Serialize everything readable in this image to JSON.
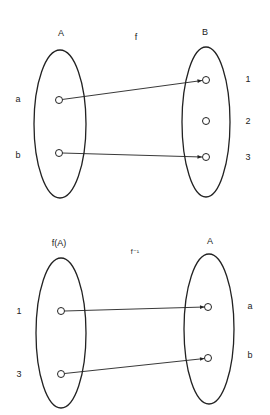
{
  "diagrams": [
    {
      "name": "function-f",
      "mapping_label": "f",
      "domain_set": {
        "label": "A",
        "elements": [
          "a",
          "b"
        ]
      },
      "codomain_set": {
        "label": "B",
        "elements": [
          "1",
          "2",
          "3"
        ]
      },
      "arrows": [
        {
          "from": "a",
          "to": "1"
        },
        {
          "from": "b",
          "to": "3"
        }
      ]
    },
    {
      "name": "inverse-function",
      "mapping_label": "f⁻¹",
      "domain_set": {
        "label": "f(A)",
        "elements": [
          "1",
          "3"
        ]
      },
      "codomain_set": {
        "label": "A",
        "elements": [
          "a",
          "b"
        ]
      },
      "arrows": [
        {
          "from": "1",
          "to": "a"
        },
        {
          "from": "3",
          "to": "b"
        }
      ]
    }
  ],
  "colors": {
    "ink": "#222222",
    "background": "#ffffff"
  }
}
